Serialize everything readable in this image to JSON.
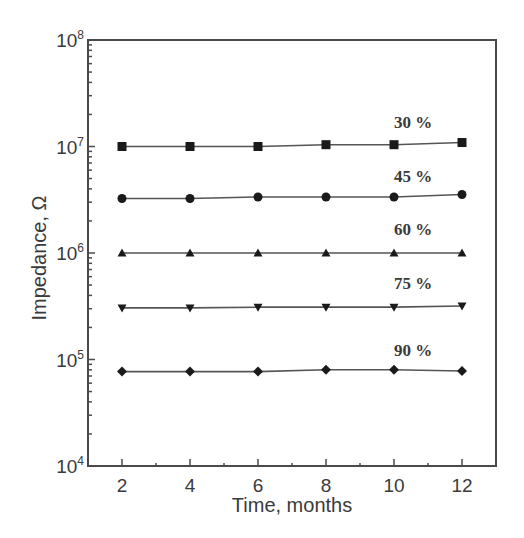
{
  "chart_data": {
    "type": "line",
    "title": "",
    "xlabel": "Time, months",
    "ylabel": "Impedance, Ω",
    "xlim": [
      1,
      13
    ],
    "ylim": [
      10000,
      100000000
    ],
    "yscale": "log",
    "grid": false,
    "legend": "inline labels at right",
    "x": [
      2,
      4,
      6,
      8,
      10,
      12
    ],
    "x_ticks": [
      "2",
      "4",
      "6",
      "8",
      "10",
      "12"
    ],
    "y_ticks": [
      {
        "base": "10",
        "exp": "4",
        "value": 10000
      },
      {
        "base": "10",
        "exp": "5",
        "value": 100000
      },
      {
        "base": "10",
        "exp": "6",
        "value": 1000000
      },
      {
        "base": "10",
        "exp": "7",
        "value": 10000000
      },
      {
        "base": "10",
        "exp": "8",
        "value": 100000000
      }
    ],
    "series": [
      {
        "name": "30 %",
        "marker": "square",
        "values": [
          10000000,
          10000000,
          10000000,
          10400000,
          10400000,
          10900000
        ]
      },
      {
        "name": "45 %",
        "marker": "circle",
        "values": [
          3250000,
          3250000,
          3360000,
          3360000,
          3360000,
          3540000
        ]
      },
      {
        "name": "60 %",
        "marker": "triangle-up",
        "values": [
          1000000,
          1000000,
          1000000,
          1000000,
          1000000,
          1000000
        ]
      },
      {
        "name": "75 %",
        "marker": "triangle-down",
        "values": [
          305000,
          305000,
          310000,
          310000,
          310000,
          318000
        ]
      },
      {
        "name": "90 %",
        "marker": "diamond",
        "values": [
          77000,
          77000,
          77000,
          80000,
          80000,
          78000
        ]
      }
    ]
  },
  "labels": {
    "xlabel": "Time, months",
    "ylabel": "Impedance, Ω",
    "series": [
      "30 %",
      "45 %",
      "60 %",
      "75 %",
      "90 %"
    ]
  }
}
